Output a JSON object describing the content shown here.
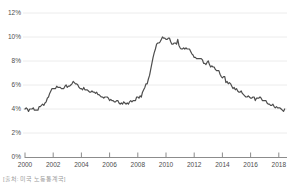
{
  "source_note": "[출처: 미국 노동통계국]",
  "colors": {
    "line": "#4d4d4d",
    "grid": "#ececec",
    "axis": "#8c8c8c",
    "tick_label": "#4d4d4d",
    "source_text": "#9b9b9b",
    "background": "#ffffff"
  },
  "chart_data": {
    "type": "line",
    "title": "",
    "xlabel": "",
    "ylabel": "",
    "grid": "horizontal",
    "legend": "none",
    "ylim": [
      0,
      12
    ],
    "y_tick_values": [
      0,
      2,
      4,
      6,
      8,
      10,
      12
    ],
    "y_tick_labels": [
      "0%",
      "2%",
      "4%",
      "6%",
      "8%",
      "10%",
      "12%"
    ],
    "x_tick_years": [
      2000,
      2002,
      2004,
      2006,
      2008,
      2010,
      2012,
      2014,
      2016,
      2018
    ],
    "x_tick_labels": [
      "2000",
      "2002",
      "2004",
      "2006",
      "2008",
      "2010",
      "2012",
      "2014",
      "2016",
      "2018"
    ],
    "series": [
      {
        "name": "US unemployment rate (%)",
        "frequency": "monthly",
        "start_year": 2000,
        "start_month": 1,
        "values": [
          4.0,
          4.1,
          4.0,
          3.8,
          4.0,
          4.0,
          4.0,
          4.1,
          3.9,
          3.9,
          3.9,
          3.9,
          4.2,
          4.2,
          4.3,
          4.4,
          4.3,
          4.5,
          4.6,
          4.9,
          5.0,
          5.3,
          5.5,
          5.7,
          5.7,
          5.7,
          5.7,
          5.9,
          5.8,
          5.8,
          5.8,
          5.7,
          5.7,
          5.7,
          5.9,
          6.0,
          5.8,
          5.9,
          5.9,
          6.0,
          6.1,
          6.3,
          6.2,
          6.1,
          6.1,
          6.0,
          5.8,
          5.7,
          5.7,
          5.6,
          5.8,
          5.6,
          5.6,
          5.6,
          5.5,
          5.4,
          5.4,
          5.5,
          5.4,
          5.4,
          5.3,
          5.4,
          5.2,
          5.2,
          5.1,
          5.0,
          5.0,
          4.9,
          5.0,
          5.0,
          5.0,
          4.9,
          4.7,
          4.8,
          4.7,
          4.7,
          4.6,
          4.6,
          4.7,
          4.7,
          4.5,
          4.4,
          4.5,
          4.4,
          4.6,
          4.5,
          4.4,
          4.5,
          4.4,
          4.6,
          4.7,
          4.6,
          4.7,
          4.7,
          4.7,
          5.0,
          5.0,
          4.9,
          5.1,
          5.0,
          5.4,
          5.6,
          5.8,
          6.1,
          6.1,
          6.5,
          6.8,
          7.3,
          7.8,
          8.3,
          8.7,
          9.0,
          9.4,
          9.5,
          9.5,
          9.6,
          9.8,
          10.0,
          9.9,
          9.9,
          9.8,
          9.8,
          9.9,
          9.9,
          9.6,
          9.4,
          9.4,
          9.5,
          9.5,
          9.4,
          9.8,
          9.3,
          9.1,
          9.0,
          9.0,
          9.1,
          9.0,
          9.1,
          9.0,
          9.0,
          9.0,
          8.8,
          8.6,
          8.5,
          8.3,
          8.3,
          8.2,
          8.2,
          8.2,
          8.2,
          8.2,
          8.1,
          7.8,
          7.8,
          7.7,
          7.9,
          8.0,
          7.7,
          7.5,
          7.6,
          7.5,
          7.5,
          7.3,
          7.2,
          7.2,
          7.2,
          6.9,
          6.7,
          6.6,
          6.7,
          6.7,
          6.2,
          6.3,
          6.1,
          6.2,
          6.1,
          5.9,
          5.7,
          5.8,
          5.6,
          5.7,
          5.5,
          5.4,
          5.4,
          5.5,
          5.3,
          5.2,
          5.1,
          5.0,
          5.0,
          5.1,
          5.0,
          4.9,
          4.9,
          5.0,
          5.0,
          4.7,
          4.9,
          4.9,
          4.9,
          5.0,
          4.9,
          4.7,
          4.7,
          4.7,
          4.7,
          4.5,
          4.4,
          4.4,
          4.3,
          4.3,
          4.4,
          4.2,
          4.1,
          4.2,
          4.1,
          4.1,
          4.1,
          4.0,
          3.9,
          3.8,
          4.0
        ]
      }
    ]
  }
}
